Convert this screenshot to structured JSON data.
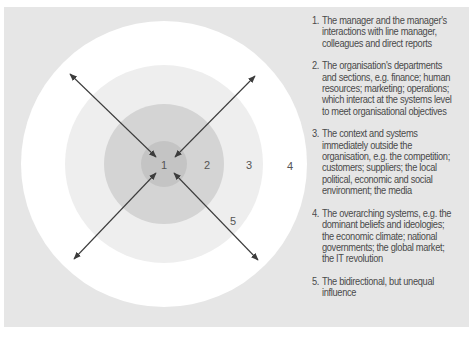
{
  "colors": {
    "background": "#e6e6e6",
    "ring4": "#ffffff",
    "ring3": "#eeeeee",
    "ring2": "#d4d4d4",
    "ring1": "#c4c4c4",
    "arrow": "#3c3c3c",
    "text": "#4a4a4a"
  },
  "diagram": {
    "rings": [
      {
        "id": "4",
        "label": "4"
      },
      {
        "id": "3",
        "label": "3"
      },
      {
        "id": "2",
        "label": "2"
      },
      {
        "id": "1",
        "label": "1"
      }
    ],
    "arrow_label": "5"
  },
  "legend": {
    "items": [
      {
        "num": "1.",
        "text": "The manager and the manager's interactions with line manager, colleagues and direct reports"
      },
      {
        "num": "2.",
        "text": "The organisation's departments and sections, e.g. finance; human resources; marketing; operations; which interact at the systems level to meet organisational objectives"
      },
      {
        "num": "3.",
        "text": "The context and systems immediately outside the organisation, e.g. the competition; customers; suppliers; the local political, economic and social environment; the media"
      },
      {
        "num": "4.",
        "text": "The overarching systems, e.g. the dominant beliefs and ideologies; the economic climate; national governments; the global market; the IT revolution"
      },
      {
        "num": "5.",
        "text": "The bidirectional, but unequal influence"
      }
    ]
  }
}
